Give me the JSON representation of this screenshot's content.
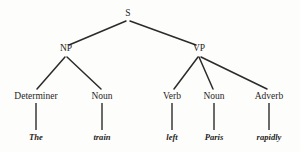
{
  "diagram": {
    "type": "constituency-syntax-tree",
    "title": "",
    "sentence": "The train left Paris rapidly",
    "background_color": "#fdfdfb",
    "line_color": "#2b2b2b",
    "text_color": "#1f1f1f"
  },
  "nodes": {
    "s": {
      "label": "S",
      "x": 128,
      "y": 16,
      "branch_y": 21
    },
    "np": {
      "label": "NP",
      "x": 66,
      "y": 51,
      "branch_y": 57
    },
    "vp": {
      "label": "VP",
      "x": 199,
      "y": 51,
      "branch_y": 57
    },
    "determiner": {
      "label": "Determiner",
      "x": 36,
      "y": 99,
      "top_y": 88,
      "stem_bottom": 130
    },
    "noun1": {
      "label": "Noun",
      "x": 102,
      "y": 99,
      "top_y": 88,
      "stem_bottom": 130
    },
    "verb": {
      "label": "Verb",
      "x": 172,
      "y": 99,
      "top_y": 88,
      "stem_bottom": 130
    },
    "noun2": {
      "label": "Noun",
      "x": 214,
      "y": 99,
      "top_y": 88,
      "stem_bottom": 130
    },
    "adverb": {
      "label": "Adverb",
      "x": 269,
      "y": 99,
      "top_y": 88,
      "stem_bottom": 130
    }
  },
  "leaves": {
    "the": {
      "label": "The",
      "x": 36,
      "y": 140
    },
    "train": {
      "label": "train",
      "x": 102,
      "y": 140
    },
    "left": {
      "label": "left",
      "x": 172,
      "y": 140
    },
    "paris": {
      "label": "Paris",
      "x": 214,
      "y": 140
    },
    "rapidly": {
      "label": "rapidly",
      "x": 269,
      "y": 140
    }
  },
  "edges": [
    {
      "name": "edge-s-np",
      "x1": 126,
      "y1": 21,
      "x2": 69,
      "y2": 45
    },
    {
      "name": "edge-s-vp",
      "x1": 130,
      "y1": 21,
      "x2": 196,
      "y2": 45
    },
    {
      "name": "edge-np-determiner",
      "x1": 65,
      "y1": 57,
      "x2": 37,
      "y2": 89
    },
    {
      "name": "edge-np-noun",
      "x1": 67,
      "y1": 57,
      "x2": 101,
      "y2": 89
    },
    {
      "name": "edge-vp-verb",
      "x1": 198,
      "y1": 57,
      "x2": 174,
      "y2": 89
    },
    {
      "name": "edge-vp-noun",
      "x1": 199,
      "y1": 57,
      "x2": 213,
      "y2": 89
    },
    {
      "name": "edge-vp-adverb",
      "x1": 201,
      "y1": 57,
      "x2": 267,
      "y2": 89
    }
  ],
  "stems": [
    {
      "name": "stem-determiner-the",
      "x": 36,
      "y1": 103,
      "y2": 130
    },
    {
      "name": "stem-noun-train",
      "x": 102,
      "y1": 103,
      "y2": 130
    },
    {
      "name": "stem-verb-left",
      "x": 172,
      "y1": 103,
      "y2": 130
    },
    {
      "name": "stem-noun-paris",
      "x": 214,
      "y1": 103,
      "y2": 130
    },
    {
      "name": "stem-adverb-rapidly",
      "x": 269,
      "y1": 103,
      "y2": 130
    }
  ]
}
